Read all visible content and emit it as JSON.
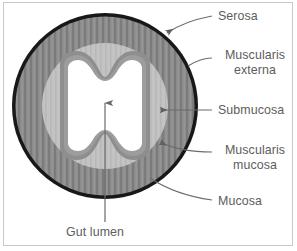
{
  "figure": {
    "background_color": "#ffffff",
    "frame_color": "#c9c9c9",
    "label_color": "#5d5d5d",
    "leader_color": "#6b6b6b"
  },
  "layers": [
    {
      "name": "serosa",
      "label": "Serosa",
      "color": "#151515",
      "description": "thin black outermost ring"
    },
    {
      "name": "muscularis-externa",
      "label_line1": "Muscularis",
      "label_line2": "externa",
      "label": "Muscularis externa",
      "color": "#8a8a8a",
      "description": "thick striated grey ring"
    },
    {
      "name": "submucosa",
      "label": "Submucosa",
      "color": "#c4c4c4",
      "description": "light grey ring"
    },
    {
      "name": "muscularis-mucosa",
      "label_line1": "Muscularis",
      "label_line2": "mucosa",
      "label": "Muscularis mucosa",
      "color": "#8e8e8e",
      "description": "grey band lining the lumen"
    },
    {
      "name": "mucosa",
      "label": "Mucosa",
      "color": "#9a9a9a",
      "description": "innermost lining around the lumen"
    },
    {
      "name": "gut-lumen",
      "label": "Gut lumen",
      "color": "#ffffff",
      "description": "white hourglass-shaped central cavity"
    }
  ],
  "labels": {
    "serosa": "Serosa",
    "muscularis_externa_line1": "Muscularis",
    "muscularis_externa_line2": "externa",
    "submucosa": "Submucosa",
    "muscularis_mucosa_line1": "Muscularis",
    "muscularis_mucosa_line2": "mucosa",
    "mucosa": "Mucosa",
    "gut_lumen": "Gut lumen"
  }
}
